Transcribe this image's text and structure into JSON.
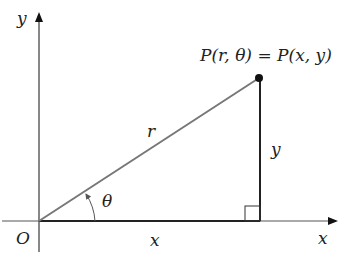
{
  "diagram": {
    "origin_label": "O",
    "x_axis_label": "x",
    "y_axis_label": "y",
    "point_label": "P(r, θ) = P(x, y)",
    "radius_label": "r",
    "angle_label": "θ",
    "adjacent_label": "x",
    "opposite_label": "y",
    "colors": {
      "axes": "#555555",
      "radius": "#777777",
      "sides": "#222222",
      "point": "#111111"
    }
  }
}
